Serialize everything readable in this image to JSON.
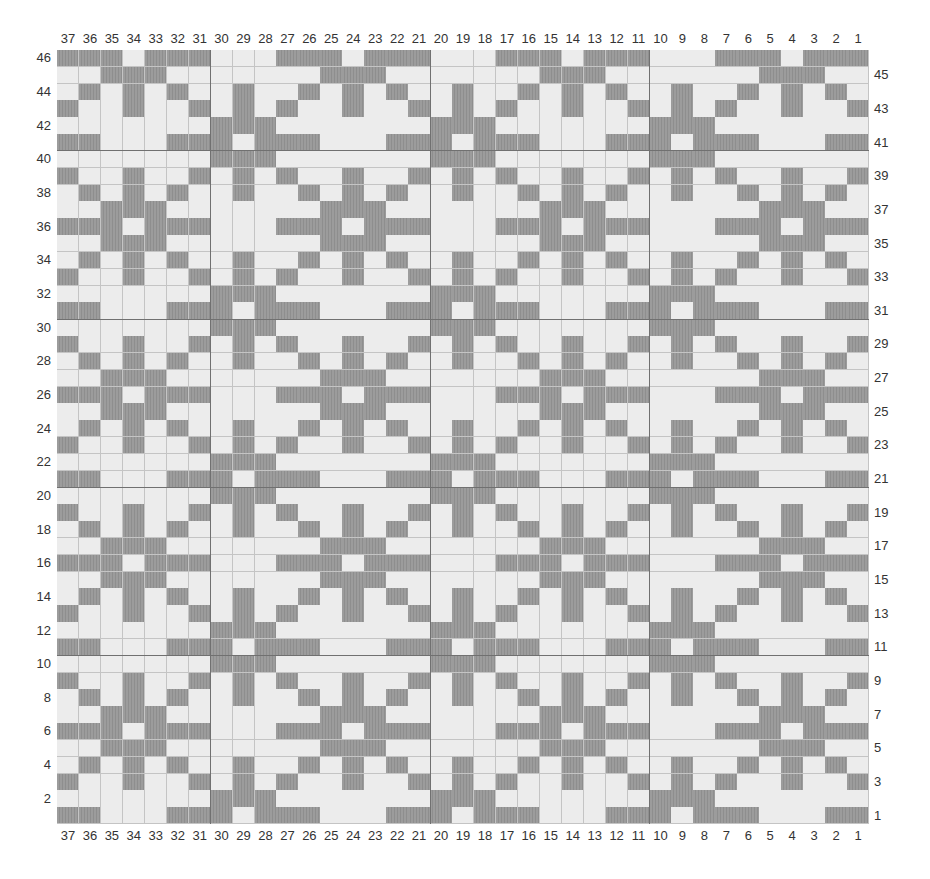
{
  "chart": {
    "type": "knitting-colorwork-chart",
    "columns": 37,
    "rows": 46,
    "column_numbering": "right-to-left (37 at left, 1 at right)",
    "row_numbering": "bottom-to-top (1 at bottom, 46 at top)",
    "left_row_labels": "even rows",
    "right_row_labels": "odd rows",
    "repeat_size": 10,
    "colors": {
      "dark": "#9c9c9c",
      "light": "#ececec",
      "grid_line": "#c4c4c4",
      "block_line": "#707070",
      "label": "#333333"
    },
    "legend_note": "D = dark (contrast) stitch, L = light (background) stitch",
    "repeat_pattern": {
      "description": "rows 1..10 bottom to top; each string is 10 stitches for cols 30..21 (same for 20..11, 10..1; cols 37..31 follow cols 27..21)",
      "rows": [
        "DLDDDLLLDD",
        "DDDLLLLLLL",
        "LDLDLLDLLD",
        "LDLLDLDLDL",
        "LLLLLDDDLL",
        "LLLDDDLDDD",
        "LLLLLDDDLL",
        "LDLLDLDLDL",
        "LDLDLLDLLD",
        "DDDLLLLLLL"
      ]
    },
    "block_lines_after_columns": [
      31,
      21,
      11
    ],
    "block_lines_above_rows": [
      10,
      20,
      30,
      40
    ]
  }
}
